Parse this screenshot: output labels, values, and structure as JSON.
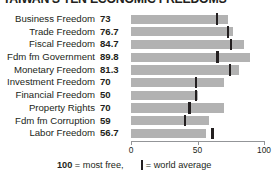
{
  "chart_data": {
    "type": "bar",
    "title": "TAIWAN'S TEN ECONOMIC FREEDOMS",
    "orientation": "horizontal",
    "categories": [
      "Business Freedom",
      "Trade Freedom",
      "Fiscal Freedom",
      "Fdm fm Government",
      "Monetary Freedom",
      "Investment Freedom",
      "Financial Freedom",
      "Property Rights",
      "Fdm fm Corruption",
      "Labor Freedom"
    ],
    "values": [
      73,
      76.7,
      84.7,
      89.8,
      81.3,
      70,
      50,
      70,
      59,
      56.7
    ],
    "value_labels": [
      "73",
      "76.7",
      "84.7",
      "89.8",
      "81.3",
      "70",
      "50",
      "70",
      "59",
      "56.7"
    ],
    "world_average": [
      64.6,
      73.2,
      74.9,
      65.0,
      74.2,
      49.0,
      49.1,
      44.0,
      40.5,
      61.3
    ],
    "series": [
      {
        "name": "Taiwan score",
        "values": [
          73,
          76.7,
          84.7,
          89.8,
          81.3,
          70,
          50,
          70,
          59,
          56.7
        ]
      },
      {
        "name": "world average",
        "values": [
          64.6,
          73.2,
          74.9,
          65.0,
          74.2,
          49.0,
          49.1,
          44.0,
          40.5,
          61.3
        ]
      }
    ],
    "xlabel": "",
    "ylabel": "",
    "xlim": [
      0,
      100
    ],
    "xticks": [
      0,
      50,
      100
    ],
    "xtick_labels": [
      "0",
      "50",
      "100"
    ],
    "grid": false,
    "legend_position": "bottom",
    "bar_color": "#b2b2b2",
    "tick_color": "#231f20",
    "axis_color": "#939598"
  },
  "legend": {
    "most_free_value": "100",
    "most_free_text": "= most free,",
    "average_text": "= world average",
    "marker_name": "world-average-marker"
  }
}
